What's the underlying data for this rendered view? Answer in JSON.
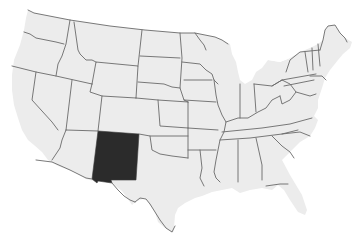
{
  "map": {
    "title": "United States",
    "highlighted_state": "New Mexico",
    "colors": {
      "background": "#ffffff",
      "land": "#ececec",
      "border": "#6a6a6a",
      "highlight": "#2b2b2b"
    }
  }
}
